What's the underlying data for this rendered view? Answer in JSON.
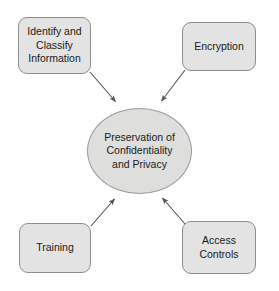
{
  "diagram": {
    "type": "hub-and-spoke",
    "center": {
      "id": "preservation-hub",
      "label": "Preservation of\nConfidentiality\nand Privacy",
      "shape": "ellipse",
      "fill": "#dededd",
      "stroke": "#9a9a9a"
    },
    "nodes": [
      {
        "id": "identify-and-classify-information",
        "label": "Identify and\nClassify\nInformation",
        "position": "top-left",
        "shape": "rounded-rectangle",
        "fill": "#e3e3e3",
        "stroke": "#8e8e8e"
      },
      {
        "id": "encryption",
        "label": "Encryption",
        "position": "top-right",
        "shape": "rounded-rectangle",
        "fill": "#e3e3e3",
        "stroke": "#8e8e8e"
      },
      {
        "id": "training",
        "label": "Training",
        "position": "bottom-left",
        "shape": "rounded-rectangle",
        "fill": "#e3e3e3",
        "stroke": "#8e8e8e"
      },
      {
        "id": "access-controls",
        "label": "Access\nControls",
        "position": "bottom-right",
        "shape": "rounded-rectangle",
        "fill": "#e3e3e3",
        "stroke": "#8e8e8e"
      }
    ],
    "connectors": [
      {
        "id": "arrow-identify-to-hub",
        "from": "identify-and-classify-information",
        "to": "preservation-hub",
        "style": "solid-arrow",
        "color": "#545454"
      },
      {
        "id": "arrow-encryption-to-hub",
        "from": "encryption",
        "to": "preservation-hub",
        "style": "solid-arrow",
        "color": "#545454"
      },
      {
        "id": "arrow-training-to-hub",
        "from": "training",
        "to": "preservation-hub",
        "style": "solid-arrow",
        "color": "#545454"
      },
      {
        "id": "arrow-access-to-hub",
        "from": "access-controls",
        "to": "preservation-hub",
        "style": "solid-arrow",
        "color": "#545454"
      }
    ],
    "background": "#ffffff"
  }
}
